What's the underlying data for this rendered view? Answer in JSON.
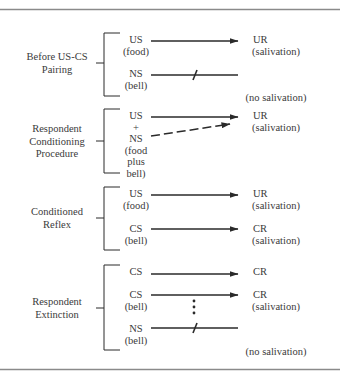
{
  "colors": {
    "ink": "#2a2a2a",
    "rule": "#8a8a8a",
    "text": "#3a3a3a"
  },
  "rules": {
    "top_y": 9.5,
    "bottom_y": 369.5,
    "x1": 0,
    "x2": 340
  },
  "sections": [
    {
      "id": "before-pairing",
      "label": [
        "Before US-CS",
        "Pairing"
      ],
      "label_y": 63,
      "bracket": {
        "top": 33,
        "bottom": 96,
        "mid": 63
      },
      "rows": [
        {
          "left": [
            "US",
            "(food)"
          ],
          "left_y": 43,
          "arrow": "solid",
          "ay": 41,
          "right": [
            "UR",
            "(salivation)"
          ],
          "right_y": 43
        },
        {
          "left": [
            "NS",
            "(bell)"
          ],
          "left_y": 77,
          "arrow": "blocked",
          "ay": 75,
          "right": [
            "",
            "(no salivation)"
          ],
          "right_y": 89
        }
      ]
    },
    {
      "id": "conditioning-procedure",
      "label": [
        "Respondent",
        "Conditioning",
        "Procedure"
      ],
      "label_y": 141,
      "bracket": {
        "top": 109,
        "bottom": 173,
        "mid": 141
      },
      "rows": [
        {
          "left": [
            "US",
            "+",
            "NS",
            "(food",
            "plus",
            "bell)"
          ],
          "left_y": 119,
          "arrow": "solid",
          "ay": 117,
          "right": [
            "UR",
            "(salivation)"
          ],
          "right_y": 119
        },
        {
          "left": [],
          "left_y": 0,
          "arrow": "dashed",
          "ay": 136,
          "right": [],
          "right_y": 0
        }
      ]
    },
    {
      "id": "conditioned-reflex",
      "label": [
        "Conditioned",
        "Reflex"
      ],
      "label_y": 218,
      "bracket": {
        "top": 187,
        "bottom": 250,
        "mid": 218
      },
      "rows": [
        {
          "left": [
            "US",
            "(food)"
          ],
          "left_y": 197,
          "arrow": "solid",
          "ay": 195,
          "right": [
            "UR",
            "(salivation)"
          ],
          "right_y": 197
        },
        {
          "left": [
            "CS",
            "(bell)"
          ],
          "left_y": 232,
          "arrow": "solid",
          "ay": 229,
          "right": [
            "CR",
            "(salivation)"
          ],
          "right_y": 232
        }
      ]
    },
    {
      "id": "respondent-extinction",
      "label": [
        "Respondent",
        "Extinction"
      ],
      "label_y": 308,
      "bracket": {
        "top": 265,
        "bottom": 350,
        "mid": 308
      },
      "rows": [
        {
          "left": [
            "CS"
          ],
          "left_y": 275,
          "arrow": "solid",
          "ay": 274,
          "right": [
            "CR"
          ],
          "right_y": 275
        },
        {
          "left": [
            "CS",
            "(bell)"
          ],
          "left_y": 298,
          "arrow": "solid",
          "ay": 295,
          "right": [
            "CR",
            "(salivation)"
          ],
          "right_y": 298
        },
        {
          "left": [
            "NS",
            "(bell)"
          ],
          "left_y": 332,
          "arrow": "blocked",
          "ay": 328,
          "right": [
            "",
            "(no salivation)"
          ],
          "right_y": 343
        }
      ],
      "ellipsis": {
        "x": 194,
        "y": [
          301,
          307,
          313
        ]
      }
    }
  ]
}
